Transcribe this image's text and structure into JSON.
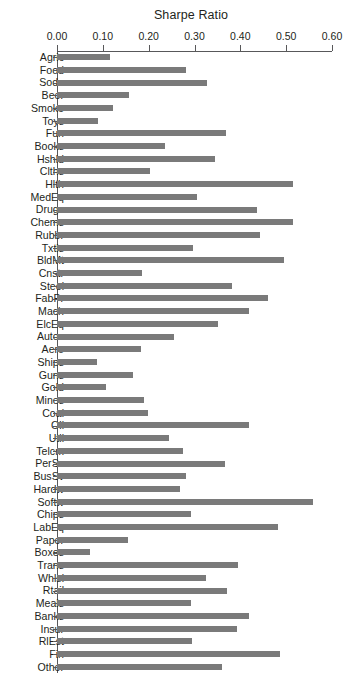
{
  "chart_data": {
    "type": "bar",
    "orientation": "horizontal",
    "title": "Sharpe Ratio",
    "xlabel": "",
    "ylabel": "",
    "xlim": [
      0.0,
      0.6
    ],
    "grid": false,
    "legend": null,
    "axis_position": "top",
    "bar_color": "#7a7a7a",
    "axis_color": "#58585a",
    "text_color": "#231f20",
    "tick_labels": [
      "0.00",
      "0.10",
      "0.20",
      "0.30",
      "0.40",
      "0.50",
      "0.60"
    ],
    "ticks": [
      0.0,
      0.1,
      0.2,
      0.3,
      0.4,
      0.5,
      0.6
    ],
    "categories": [
      "Agric",
      "Food",
      "Soda",
      "Beer",
      "Smoke",
      "Toys",
      "Fun",
      "Books",
      "Hshld",
      "Clths",
      "Hlth",
      "MedEq",
      "Drugs",
      "Chems",
      "Rubbr",
      "Txtls",
      "BldMt",
      "Cnstr",
      "Steel",
      "FabPr",
      "Mach",
      "ElcEq",
      "Autos",
      "Aero",
      "Ships",
      "Guns",
      "Gold",
      "Mines",
      "Coal",
      "Oil",
      "Util",
      "Telcm",
      "PerSv",
      "BusSv",
      "Hardw",
      "Softw",
      "Chips",
      "LabEq",
      "Paper",
      "Boxes",
      "Trans",
      "Whlsl",
      "Rtail",
      "Meals",
      "Banks",
      "Insur",
      "RlEst",
      "Fin",
      "Other"
    ],
    "values": [
      0.116,
      0.282,
      0.328,
      0.157,
      0.122,
      0.09,
      0.369,
      0.236,
      0.345,
      0.203,
      0.515,
      0.306,
      0.437,
      0.515,
      0.443,
      0.297,
      0.496,
      0.185,
      0.382,
      0.46,
      0.419,
      0.351,
      0.255,
      0.183,
      0.088,
      0.166,
      0.106,
      0.189,
      0.199,
      0.418,
      0.245,
      0.274,
      0.367,
      0.281,
      0.269,
      0.559,
      0.292,
      0.482,
      0.155,
      0.072,
      0.394,
      0.325,
      0.37,
      0.292,
      0.418,
      0.392,
      0.294,
      0.487,
      0.36
    ]
  }
}
